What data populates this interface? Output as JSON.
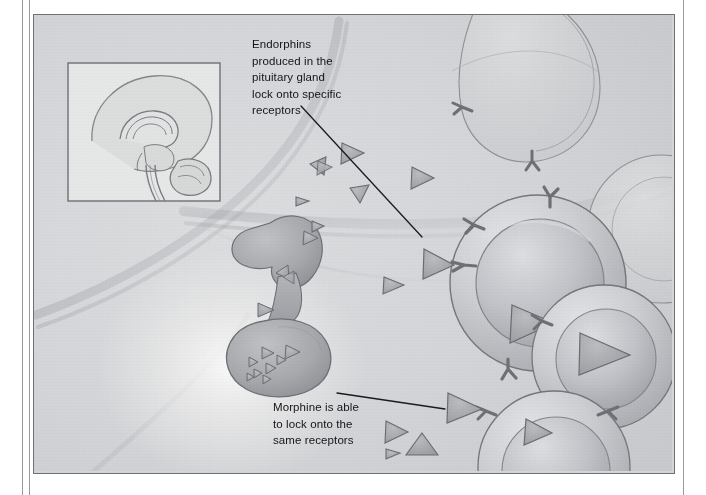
{
  "illustration": {
    "subject": "endorphin-and-morphine-receptor-binding",
    "background_color": "#d5d6d8",
    "ink_color": "#6b6c72",
    "text_color": "#141418",
    "frame_color": "#6f7076",
    "inset": {
      "name": "brain-sagittal-section",
      "border_color": "#6f7076",
      "fill": "#e4e5e6"
    },
    "pituitary": {
      "name": "pituitary-gland",
      "fill": "#a9abae",
      "glow": "#f2f2f1"
    },
    "cell": {
      "membrane_fill": "#c9cace",
      "nucleus_fill": "#bfc0c4",
      "receptor_color": "#76777d"
    },
    "molecule": {
      "name": "endorphin-molecule-triangle",
      "fill": "#a8aaae",
      "stroke": "#6b6c72"
    }
  },
  "captions": {
    "endorphins": {
      "lines": [
        "Endorphins",
        "produced in the",
        "pituitary gland",
        "lock onto specific",
        "receptors"
      ]
    },
    "morphine": {
      "lines": [
        "Morphine is able",
        "to lock onto the",
        "same receptors"
      ]
    }
  },
  "leader_lines": [
    {
      "name": "leader-line-endorphins",
      "from": [
        300,
        105
      ],
      "to": [
        421,
        236
      ]
    },
    {
      "name": "leader-line-morphine",
      "from": [
        336,
        392
      ],
      "to": [
        444,
        408
      ]
    }
  ]
}
